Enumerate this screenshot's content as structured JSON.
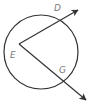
{
  "diagram": {
    "type": "geometry",
    "colors": {
      "stroke": "#333333",
      "label": "#7a7a7a",
      "background": "#ffffff"
    },
    "circle": {
      "cx": 41,
      "cy": 52,
      "r": 37
    },
    "vertex": {
      "name": "E",
      "x": 19,
      "y": 44
    },
    "rays": [
      {
        "name": "ray-ED",
        "from": "E",
        "through": "D",
        "tip": {
          "x": 78,
          "y": 10
        }
      },
      {
        "name": "ray-EG",
        "from": "E",
        "through": "G",
        "tip": {
          "x": 86,
          "y": 100
        }
      }
    ],
    "labels": {
      "D": {
        "text": "D",
        "x": 54,
        "y": 11
      },
      "E": {
        "text": "E",
        "x": 10,
        "y": 58
      },
      "G": {
        "text": "G",
        "x": 59,
        "y": 73
      }
    }
  }
}
